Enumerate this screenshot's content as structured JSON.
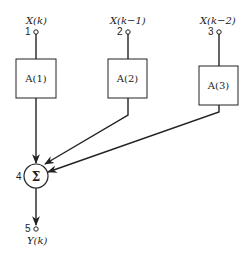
{
  "diagram": {
    "inputs": [
      {
        "node": "1",
        "signal": "X(k)"
      },
      {
        "node": "2",
        "signal": "X(k−1)"
      },
      {
        "node": "3",
        "signal": "X(k−2)"
      }
    ],
    "blocks": [
      {
        "label": "A(1)"
      },
      {
        "label": "A(2)"
      },
      {
        "label": "A(3)"
      }
    ],
    "summer": {
      "node": "4",
      "symbol": "Σ"
    },
    "output": {
      "node": "5",
      "signal": "Y(k)"
    }
  },
  "colors": {
    "stroke": "#222222",
    "background": "#ffffff"
  }
}
